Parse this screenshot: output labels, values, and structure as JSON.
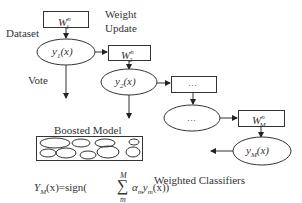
{
  "diagram": {
    "labels": {
      "dataset": "Dataset",
      "weight_update_line1": "Weight",
      "weight_update_line2": "Update",
      "vote": "Vote",
      "boosted_model": "Boosted Model",
      "weighted_classifiers": "Weighted Classifiers"
    },
    "weight_boxes": [
      {
        "base": "W",
        "sup": "n",
        "sub": "1"
      },
      {
        "base": "W",
        "sup": "n",
        "sub": "2"
      },
      {
        "base": "…",
        "sup": "",
        "sub": ""
      },
      {
        "base": "W",
        "sup": "n",
        "sub": "M"
      }
    ],
    "classifiers": [
      {
        "base": "y",
        "sub": "1",
        "arg": "(x)"
      },
      {
        "base": "y",
        "sub": "2",
        "arg": "(x)"
      },
      {
        "base": "…",
        "sub": "",
        "arg": ""
      },
      {
        "base": "y",
        "sub": "M",
        "arg": "(x)"
      }
    ],
    "formula": {
      "lhs": "Y",
      "lhs_sub": "M",
      "lhs_arg": "(x)=sign(",
      "sum_upper": "M",
      "sum_symbol": "∑",
      "sum_lower": "m",
      "term_alpha": "α",
      "term_alpha_sub": "m",
      "term_y": "y",
      "term_y_sub": "m",
      "term_end": "(x))"
    },
    "colors": {
      "stroke": "#333333",
      "text": "#333333",
      "background": "#ffffff"
    }
  }
}
